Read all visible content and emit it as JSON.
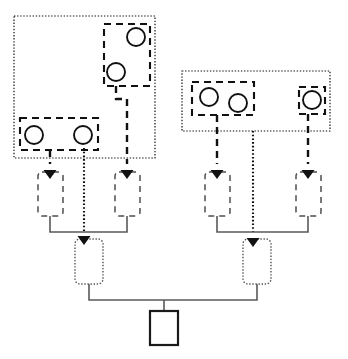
{
  "figure": {
    "title": "",
    "width": 348,
    "height": 359,
    "background": "#ffffff"
  },
  "palette": {
    "stroke_dark": "#111111",
    "stroke_mid": "#555555",
    "stroke_light": "#595959",
    "fill_white": "#ffffff"
  },
  "groups": [
    {
      "id": "group-left",
      "name": "left-dotted-group",
      "style": "dotted",
      "x": 14,
      "y": 16,
      "width": 141,
      "height": 142
    },
    {
      "id": "group-right",
      "name": "right-dotted-group",
      "style": "dotted",
      "x": 182,
      "y": 71,
      "width": 148,
      "height": 60
    }
  ],
  "clusters": [
    {
      "id": "cluster-left-upper",
      "name": "left-upper-dashed-cluster",
      "style": "dashed",
      "x": 104,
      "y": 24,
      "width": 46,
      "height": 62,
      "circles": [
        {
          "cx": 136,
          "cy": 37,
          "r": 9
        },
        {
          "cx": 116,
          "cy": 72,
          "r": 9
        }
      ]
    },
    {
      "id": "cluster-left-lower",
      "name": "left-lower-dashed-cluster",
      "style": "dashed",
      "x": 20,
      "y": 118,
      "width": 78,
      "height": 32,
      "circles": [
        {
          "cx": 34,
          "cy": 135,
          "r": 9
        },
        {
          "cx": 83,
          "cy": 135,
          "r": 9
        }
      ]
    },
    {
      "id": "cluster-right-left",
      "name": "right-left-dashed-cluster",
      "style": "dashed",
      "x": 192,
      "y": 82,
      "width": 62,
      "height": 33,
      "circles": [
        {
          "cx": 209,
          "cy": 97,
          "r": 9
        },
        {
          "cx": 238,
          "cy": 103,
          "r": 9
        }
      ]
    },
    {
      "id": "cluster-right-right",
      "name": "right-right-dashed-cluster",
      "style": "dashed",
      "x": 299,
      "y": 87,
      "width": 26,
      "height": 27,
      "circles": [
        {
          "cx": 312,
          "cy": 100,
          "r": 9
        }
      ]
    }
  ],
  "mid_nodes": [
    {
      "id": "mid-1",
      "name": "mid-node-left-a",
      "style": "dashed-thin",
      "x": 38,
      "y": 172,
      "width": 25,
      "height": 44
    },
    {
      "id": "mid-2",
      "name": "mid-node-left-b",
      "style": "dashed-thin",
      "x": 115,
      "y": 172,
      "width": 25,
      "height": 44
    },
    {
      "id": "mid-3",
      "name": "mid-node-right-a",
      "style": "dashed-thin",
      "x": 205,
      "y": 172,
      "width": 25,
      "height": 44
    },
    {
      "id": "mid-4",
      "name": "mid-node-right-b",
      "style": "dashed-thin",
      "x": 296,
      "y": 172,
      "width": 25,
      "height": 44
    }
  ],
  "merge_nodes": [
    {
      "id": "merge-left",
      "name": "merge-node-left",
      "style": "dotted",
      "x": 75,
      "y": 239,
      "width": 28,
      "height": 45
    },
    {
      "id": "merge-right",
      "name": "merge-node-right",
      "style": "dotted",
      "x": 243,
      "y": 239,
      "width": 28,
      "height": 45
    }
  ],
  "output_node": {
    "id": "output",
    "name": "output-node",
    "style": "solid",
    "x": 150,
    "y": 311,
    "width": 28,
    "height": 34
  },
  "connectors": [
    {
      "name": "dashed-left-upper-to-mid2",
      "style": "dashed",
      "path": "M 116 86 L 116 99 L 127 99 L 127 164"
    },
    {
      "name": "dashed-left-lower-to-mid1",
      "style": "dashed",
      "path": "M 50 150 L 50 156 L 50 164"
    },
    {
      "name": "dotted-left-cluster-to-merge",
      "style": "dotted",
      "path": "M 84 148 L 84 232"
    },
    {
      "name": "dashed-right-left-to-mid3",
      "style": "dashed",
      "path": "M 217 115 L 217 164"
    },
    {
      "name": "dashed-right-right-to-mid4",
      "style": "dashed",
      "path": "M 308 114 L 308 164"
    },
    {
      "name": "dotted-right-group-to-merge",
      "style": "dotted",
      "path": "M 253 131 L 253 232"
    },
    {
      "name": "solid-mid1-to-merge-left",
      "style": "solid",
      "path": "M 50 216 L 50 232 L 84 232"
    },
    {
      "name": "solid-mid2-to-merge-left",
      "style": "solid",
      "path": "M 127 216 L 127 232 L 84 232"
    },
    {
      "name": "solid-mid3-to-merge-right",
      "style": "solid",
      "path": "M 217 216 L 217 232 L 253 232"
    },
    {
      "name": "solid-mid4-to-merge-right",
      "style": "solid",
      "path": "M 308 216 L 308 232 L 253 232"
    },
    {
      "name": "solid-merge-left-to-bus",
      "style": "solid",
      "path": "M 89 284 L 89 300 L 164 300"
    },
    {
      "name": "solid-merge-right-to-bus",
      "style": "solid",
      "path": "M 257 284 L 257 300 L 164 300"
    },
    {
      "name": "solid-bus-to-output",
      "style": "solid",
      "path": "M 164 300 L 164 311"
    }
  ],
  "arrowheads": [
    {
      "name": "arrow-into-mid1",
      "x": 50,
      "y": 170,
      "dir": "down"
    },
    {
      "name": "arrow-into-mid2",
      "x": 127,
      "y": 170,
      "dir": "down"
    },
    {
      "name": "arrow-into-mid3",
      "x": 217,
      "y": 170,
      "dir": "down"
    },
    {
      "name": "arrow-into-mid4",
      "x": 308,
      "y": 170,
      "dir": "down"
    },
    {
      "name": "arrow-into-merge-left",
      "x": 84,
      "y": 236,
      "dir": "down"
    },
    {
      "name": "arrow-into-merge-right",
      "x": 253,
      "y": 238,
      "dir": "down"
    }
  ]
}
